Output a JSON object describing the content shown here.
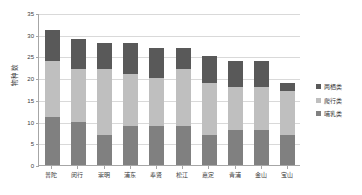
{
  "chart_data": {
    "type": "bar",
    "subtype": "stacked-column",
    "title": "",
    "xlabel": "",
    "ylabel": "物种数",
    "ylim": [
      0,
      35
    ],
    "yticks": [
      0,
      5,
      10,
      15,
      20,
      25,
      30,
      35
    ],
    "ytick_labels": [
      "0",
      "5",
      "10",
      "15",
      "20",
      "25",
      "30",
      "35"
    ],
    "grid": true,
    "legend_position": "right",
    "categories": [
      "普陀",
      "闵行",
      "崇明",
      "浦东",
      "奉贤",
      "松江",
      "嘉定",
      "青浦",
      "金山",
      "宝山"
    ],
    "series": [
      {
        "name": "哺乳类",
        "color": "#808080",
        "values": [
          11,
          10,
          7,
          9,
          9,
          9,
          7,
          8,
          8,
          7
        ]
      },
      {
        "name": "爬行类",
        "color": "#bfbfbf",
        "values": [
          13,
          12,
          15,
          12,
          11,
          13,
          12,
          10,
          10,
          10
        ]
      },
      {
        "name": "两栖类",
        "color": "#595959",
        "values": [
          7,
          7,
          6,
          7,
          7,
          5,
          6,
          6,
          6,
          2
        ]
      }
    ],
    "totals": [
      31,
      29,
      28,
      28,
      27,
      27,
      25,
      24,
      24,
      19
    ]
  },
  "legend": {
    "items": [
      {
        "label": "两栖类",
        "color": "#595959"
      },
      {
        "label": "爬行类",
        "color": "#bfbfbf"
      },
      {
        "label": "哺乳类",
        "color": "#808080"
      }
    ]
  },
  "axes": {
    "y_title": "物种数"
  }
}
